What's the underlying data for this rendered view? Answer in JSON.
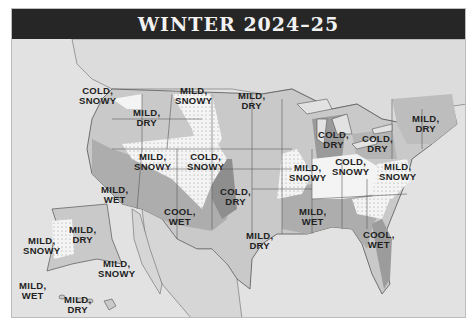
{
  "title": "WINTER 2024–25",
  "colors": {
    "title_bg": "#262626",
    "title_text": "#f2f2f2",
    "water": "#e2e2e2",
    "land_light": "#c9c9c9",
    "land_medium": "#adadad",
    "land_dark": "#8e8e8e",
    "snow_zone": "#f4f4f4",
    "border": "#5a5a5a"
  },
  "regions": [
    {
      "id": "pacific-northwest",
      "line1": "COLD,",
      "line2": "SNOWY"
    },
    {
      "id": "northern-rockies",
      "line1": "MILD,",
      "line2": "SNOWY"
    },
    {
      "id": "intermountain",
      "line1": "MILD,",
      "line2": "DRY"
    },
    {
      "id": "northern-plains",
      "line1": "MILD,",
      "line2": "DRY"
    },
    {
      "id": "great-basin",
      "line1": "MILD,",
      "line2": "SNOWY"
    },
    {
      "id": "central-rockies",
      "line1": "COLD,",
      "line2": "SNOWY"
    },
    {
      "id": "pacific-southwest",
      "line1": "MILD,",
      "line2": "WET"
    },
    {
      "id": "desert-southwest",
      "line1": "COOL,",
      "line2": "WET"
    },
    {
      "id": "high-plains-south",
      "line1": "COLD,",
      "line2": "DRY"
    },
    {
      "id": "upper-midwest",
      "line1": "COLD,",
      "line2": "DRY"
    },
    {
      "id": "ohio-valley-north",
      "line1": "COLD,",
      "line2": "DRY"
    },
    {
      "id": "heartland",
      "line1": "MILD,",
      "line2": "SNOWY"
    },
    {
      "id": "ohio-valley",
      "line1": "COLD,",
      "line2": "SNOWY"
    },
    {
      "id": "appalachians",
      "line1": "MILD,",
      "line2": "SNOWY"
    },
    {
      "id": "northeast",
      "line1": "MILD,",
      "line2": "DRY"
    },
    {
      "id": "texas-oklahoma",
      "line1": "MILD,",
      "line2": "DRY"
    },
    {
      "id": "deep-south",
      "line1": "MILD,",
      "line2": "WET"
    },
    {
      "id": "southeast",
      "line1": "COOL,",
      "line2": "WET"
    },
    {
      "id": "alaska-north",
      "line1": "MILD,",
      "line2": "DRY"
    },
    {
      "id": "alaska-west",
      "line1": "MILD,",
      "line2": "SNOWY"
    },
    {
      "id": "alaska-south",
      "line1": "MILD,",
      "line2": "SNOWY"
    },
    {
      "id": "hawaii-west",
      "line1": "MILD,",
      "line2": "WET"
    },
    {
      "id": "hawaii-east",
      "line1": "MILD,",
      "line2": "DRY"
    }
  ]
}
